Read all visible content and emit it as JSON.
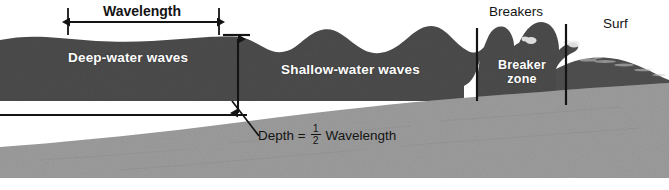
{
  "figure": {
    "width": 669,
    "height": 190
  },
  "labels": {
    "wavelength": "Wavelength",
    "deep_water_waves": "Deep-water waves",
    "shallow_water_waves": "Shallow-water waves",
    "breakers": "Breakers",
    "breaker_zone": "Breaker zone",
    "surf": "Surf",
    "depth_prefix": "Depth =",
    "depth_numerator": "1",
    "depth_denominator": "2",
    "depth_suffix": "Wavelength"
  },
  "colors": {
    "water": "#4b4b4b",
    "water_light": "#565656",
    "seafloor": "#9c9c9c",
    "seafloor_dark": "#8f8f8f",
    "background": "#ffffff",
    "ink": "#141414",
    "label_text": "#ffffff"
  },
  "annotations": {
    "wavelength_measure": {
      "name": "wavelength-span",
      "x_start": 68,
      "x_end": 219,
      "y": 22
    },
    "depth_measure": {
      "name": "depth-span",
      "x": 238,
      "y_top": 37,
      "y_bottom": 115
    },
    "depth_baseline": {
      "name": "half-wavelength-depth-line",
      "x_start": 0,
      "x_end": 246,
      "y": 115
    },
    "leader_line": {
      "name": "depth-callout-leader",
      "x_start": 231,
      "y_start": 103,
      "x_end": 258,
      "y_end": 134
    },
    "zone_dividers": [
      {
        "name": "breaker-zone-left-divider",
        "x": 477,
        "y_top": 28,
        "y_bottom": 101
      },
      {
        "name": "breaker-zone-right-divider",
        "x": 566,
        "y_top": 24,
        "y_bottom": 105
      }
    ]
  }
}
